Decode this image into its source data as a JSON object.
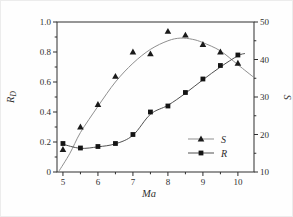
{
  "figure": {
    "background": "#fefefe",
    "axis_color": "#2e2e2e",
    "text_color": "#2e2e2e"
  },
  "chart_data": {
    "type": "line",
    "title": "",
    "xlabel": "Ma",
    "ylabel_left": {
      "base": "R",
      "sub": "D"
    },
    "ylabel_right": "S",
    "grid": false,
    "x_axis": {
      "range": [
        4.83,
        10.46
      ],
      "major_ticks": [
        5,
        6,
        7,
        8,
        9,
        10
      ],
      "tick_labels": [
        "5",
        "6",
        "7",
        "8",
        "9",
        "10"
      ],
      "minor_ticks": [
        5.5,
        6.5,
        7.5,
        8.5,
        9.5
      ]
    },
    "y_left_axis": {
      "range": [
        0,
        1
      ],
      "major_ticks": [
        0,
        0.2,
        0.4,
        0.6,
        0.8,
        1.0
      ],
      "tick_labels": [
        "0",
        "0.2",
        "0.4",
        "0.6",
        "0.8",
        "1.0"
      ],
      "minor_ticks": [
        0.1,
        0.3,
        0.5,
        0.7,
        0.9
      ]
    },
    "y_right_axis": {
      "range": [
        10,
        50
      ],
      "major_ticks": [
        10,
        20,
        30,
        40,
        50
      ],
      "tick_labels": [
        "10",
        "20",
        "30",
        "40",
        "50"
      ],
      "minor_ticks": [
        15,
        25,
        35,
        45
      ]
    },
    "x": [
      5,
      5.5,
      6,
      6.5,
      7,
      7.5,
      8,
      8.5,
      9,
      9.5,
      10
    ],
    "series": [
      {
        "name": "S",
        "axis": "right",
        "marker": "triangle",
        "line_color": "#8f8f8f",
        "marker_color": "#1a1a1a",
        "values": [
          16,
          22,
          28,
          35.5,
          42,
          41.5,
          47.5,
          46.5,
          44,
          42,
          39
        ],
        "fit": [
          [
            4.87,
            10
          ],
          [
            5.2,
            15
          ],
          [
            5.5,
            20.5
          ],
          [
            6,
            27.5
          ],
          [
            6.5,
            34
          ],
          [
            7,
            39
          ],
          [
            7.5,
            42.7
          ],
          [
            8,
            45
          ],
          [
            8.35,
            45.7
          ],
          [
            8.7,
            45.4
          ],
          [
            9,
            44.5
          ],
          [
            9.5,
            42.3
          ],
          [
            10,
            38.6
          ],
          [
            10.46,
            35.2
          ]
        ]
      },
      {
        "name": "R",
        "axis": "left",
        "marker": "square",
        "line_color": "#505050",
        "marker_color": "#141414",
        "values": [
          0.19,
          0.16,
          0.17,
          0.19,
          0.25,
          0.4,
          0.44,
          0.53,
          0.62,
          0.71,
          0.78
        ],
        "fit": [
          [
            5,
            0.185
          ],
          [
            5.5,
            0.158
          ],
          [
            6,
            0.168
          ],
          [
            6.5,
            0.188
          ],
          [
            7,
            0.245
          ],
          [
            7.5,
            0.385
          ],
          [
            8,
            0.445
          ],
          [
            8.5,
            0.525
          ],
          [
            9,
            0.615
          ],
          [
            9.5,
            0.7
          ],
          [
            10,
            0.775
          ],
          [
            10.2,
            0.79
          ]
        ]
      }
    ],
    "legend": {
      "position": "inside-lower-right",
      "entries": [
        {
          "label": "S",
          "marker": "triangle"
        },
        {
          "label": "R",
          "marker": "square"
        }
      ]
    }
  }
}
